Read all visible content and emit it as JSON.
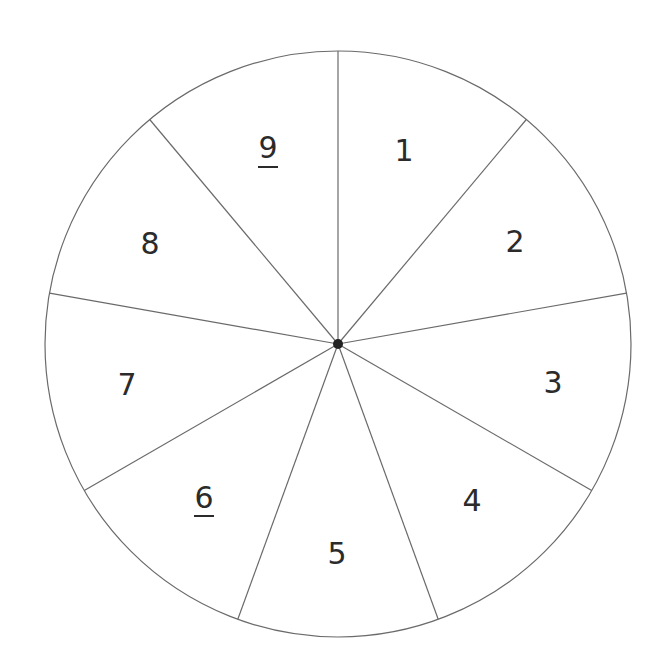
{
  "diagram": {
    "type": "spinner-wheel",
    "center": [
      338,
      344
    ],
    "radius": 293,
    "sector_count": 9,
    "start_angle_deg": -90,
    "colors": {
      "line": "#6a6a6a",
      "text": "#2b2b2b",
      "hub": "#222222",
      "background": "#ffffff"
    },
    "sectors": [
      {
        "label": "1",
        "underlined": false,
        "pos": [
          404,
          150
        ]
      },
      {
        "label": "2",
        "underlined": false,
        "pos": [
          515,
          241
        ]
      },
      {
        "label": "3",
        "underlined": false,
        "pos": [
          553,
          382
        ]
      },
      {
        "label": "4",
        "underlined": false,
        "pos": [
          472,
          500
        ]
      },
      {
        "label": "5",
        "underlined": false,
        "pos": [
          337,
          553
        ]
      },
      {
        "label": "6",
        "underlined": true,
        "pos": [
          204,
          499
        ]
      },
      {
        "label": "7",
        "underlined": false,
        "pos": [
          127,
          384
        ]
      },
      {
        "label": "8",
        "underlined": false,
        "pos": [
          150,
          243
        ]
      },
      {
        "label": "9",
        "underlined": true,
        "pos": [
          268,
          150
        ]
      }
    ]
  }
}
